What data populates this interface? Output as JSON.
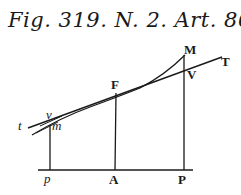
{
  "caption": "Fig. 319. N. 2. Art. 866.",
  "labels": {
    "t": "t",
    "v": "v",
    "m": "m",
    "F": "F",
    "M": "M",
    "V": "V",
    "T": "T",
    "p": "p",
    "A": "A",
    "P": "P"
  },
  "colors": {
    "ink": "#1a1a1a",
    "background": "#ffffff"
  }
}
